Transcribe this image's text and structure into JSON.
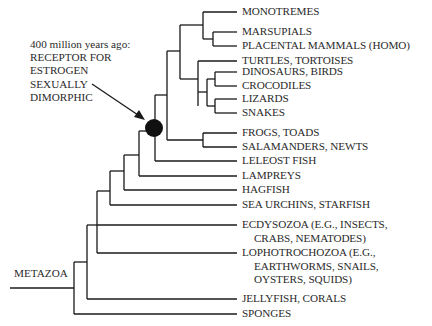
{
  "diagram": {
    "type": "phylogenetic-tree",
    "root_label": "METAZOA",
    "annotation": {
      "line1": "400 million years ago:",
      "line2": "RECEPTOR FOR",
      "line3": "ESTROGEN",
      "line4": "SEXUALLY",
      "line5": "DIMORPHIC"
    },
    "leaves": [
      {
        "label": "MONOTREMES"
      },
      {
        "label": "MARSUPIALS"
      },
      {
        "label": "PLACENTAL MAMMALS (HOMO)"
      },
      {
        "label": "TURTLES, TORTOISES"
      },
      {
        "label": "DINOSAURS, BIRDS"
      },
      {
        "label": "CROCODILES"
      },
      {
        "label": "LIZARDS"
      },
      {
        "label": "SNAKES"
      },
      {
        "label": "FROGS, TOADS"
      },
      {
        "label": "SALAMANDERS, NEWTS"
      },
      {
        "label": "LELEOST FISH"
      },
      {
        "label": "LAMPREYS"
      },
      {
        "label": "HAGFISH"
      },
      {
        "label": "SEA URCHINS, STARFISH"
      },
      {
        "label": "ECDYSOZOA (E.G., INSECTS,",
        "cont": "CRABS, NEMATODES)"
      },
      {
        "label": "LOPHOTROCHOZOA (E.G.,",
        "cont": "EARTHWORMS, SNAILS,",
        "cont2": "OYSTERS, SQUIDS)"
      },
      {
        "label": "JELLYFISH, CORALS"
      },
      {
        "label": "SPONGES"
      }
    ]
  }
}
